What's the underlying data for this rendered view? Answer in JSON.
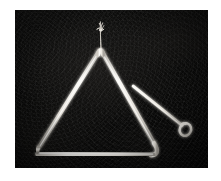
{
  "image": {
    "kind": "photograph",
    "subject": "musical triangle percussion instrument with beater",
    "alt_text": "A metal musical triangle hanging from a thin cord against a dark cloth background, with a straight metal beater rod resting to its right",
    "width": 221,
    "height": 181,
    "border_color": "#ffffff",
    "background_color": "#0a0a09",
    "metal_color": "#f2f0ea"
  },
  "photo": {
    "frame": {
      "x": 0,
      "y": 0,
      "width": 221,
      "height": 181
    },
    "area": {
      "x": 15,
      "y": 10,
      "width": 193,
      "height": 158
    }
  },
  "objects": {
    "triangle": {
      "name": "musical triangle",
      "apex": {
        "x": 100,
        "y": 50
      },
      "left_vertex": {
        "x": 36,
        "y": 150
      },
      "right_vertex": {
        "x": 155,
        "y": 150
      },
      "bar_thickness_px": 4,
      "open_corner": "bottom-left",
      "color": "#f2f0ea"
    },
    "cord": {
      "name": "hanging cord",
      "top": {
        "x": 100,
        "y": 22
      },
      "bottom": {
        "x": 101,
        "y": 50
      },
      "knot": {
        "x": 100,
        "y": 30
      },
      "color": "#d8d4cc"
    },
    "beater": {
      "name": "metal beater rod",
      "tip": {
        "x": 133,
        "y": 86
      },
      "handle_end": {
        "x": 180,
        "y": 124
      },
      "thickness_px": 3,
      "loop": {
        "cx": 184,
        "cy": 128,
        "rx": 6,
        "ry": 7
      },
      "color": "#efece6"
    }
  },
  "labels": {
    "title": "",
    "caption": ""
  }
}
